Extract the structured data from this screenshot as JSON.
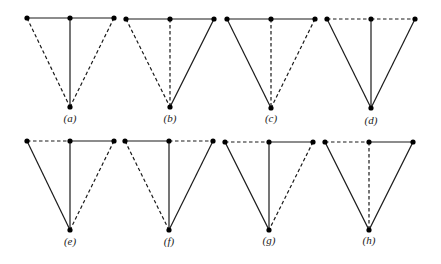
{
  "figure": {
    "colors": {
      "line": "#1a1a1a",
      "vertex": "#000000",
      "label": "#222222",
      "background": "#ffffff"
    },
    "edge_order": [
      "TL-TM",
      "TM-TR",
      "TL-B",
      "TM-B",
      "TR-B"
    ],
    "panels": [
      {
        "label": "(a)",
        "vertices": {
          "TL": [
            27,
            18
          ],
          "TM": [
            70,
            18
          ],
          "TR": [
            114,
            18
          ],
          "B": [
            70,
            107
          ]
        },
        "label_pos": [
          70,
          122
        ],
        "edges": {
          "TL-TM": "solid",
          "TM-TR": "solid",
          "TL-B": "dashed",
          "TM-B": "solid",
          "TR-B": "dashed"
        }
      },
      {
        "label": "(b)",
        "vertices": {
          "TL": [
            126,
            19
          ],
          "TM": [
            170,
            19
          ],
          "TR": [
            214,
            19
          ],
          "B": [
            170,
            107
          ]
        },
        "label_pos": [
          170,
          122
        ],
        "edges": {
          "TL-TM": "solid",
          "TM-TR": "solid",
          "TL-B": "dashed",
          "TM-B": "dashed",
          "TR-B": "solid"
        }
      },
      {
        "label": "(c)",
        "vertices": {
          "TL": [
            227,
            19
          ],
          "TM": [
            271,
            19
          ],
          "TR": [
            315,
            19
          ],
          "B": [
            271,
            108
          ]
        },
        "label_pos": [
          271,
          122
        ],
        "edges": {
          "TL-TM": "solid",
          "TM-TR": "solid",
          "TL-B": "solid",
          "TM-B": "dashed",
          "TR-B": "dashed"
        }
      },
      {
        "label": "(d)",
        "vertices": {
          "TL": [
            327,
            19
          ],
          "TM": [
            371,
            19
          ],
          "TR": [
            415,
            19
          ],
          "B": [
            371,
            108
          ]
        },
        "label_pos": [
          371,
          124
        ],
        "edges": {
          "TL-TM": "dashed",
          "TM-TR": "dashed",
          "TL-B": "solid",
          "TM-B": "solid",
          "TR-B": "solid"
        }
      },
      {
        "label": "(e)",
        "vertices": {
          "TL": [
            27,
            141
          ],
          "TM": [
            70,
            141
          ],
          "TR": [
            114,
            141
          ],
          "B": [
            70,
            230
          ]
        },
        "label_pos": [
          70,
          245
        ],
        "edges": {
          "TL-TM": "dashed",
          "TM-TR": "solid",
          "TL-B": "solid",
          "TM-B": "solid",
          "TR-B": "dashed"
        }
      },
      {
        "label": "(f)",
        "vertices": {
          "TL": [
            125,
            141
          ],
          "TM": [
            169,
            141
          ],
          "TR": [
            213,
            141
          ],
          "B": [
            169,
            230
          ]
        },
        "label_pos": [
          169,
          245
        ],
        "edges": {
          "TL-TM": "solid",
          "TM-TR": "dashed",
          "TL-B": "dashed",
          "TM-B": "solid",
          "TR-B": "solid"
        }
      },
      {
        "label": "(g)",
        "vertices": {
          "TL": [
            225,
            142
          ],
          "TM": [
            269,
            142
          ],
          "TR": [
            313,
            142
          ],
          "B": [
            269,
            230
          ]
        },
        "label_pos": [
          269,
          244
        ],
        "edges": {
          "TL-TM": "dashed",
          "TM-TR": "solid",
          "TL-B": "solid",
          "TM-B": "solid",
          "TR-B": "dashed"
        }
      },
      {
        "label": "(h)",
        "vertices": {
          "TL": [
            325,
            142
          ],
          "TM": [
            369,
            142
          ],
          "TR": [
            413,
            142
          ],
          "B": [
            369,
            230
          ]
        },
        "label_pos": [
          369,
          244
        ],
        "edges": {
          "TL-TM": "dashed",
          "TM-TR": "solid",
          "TL-B": "solid",
          "TM-B": "dashed",
          "TR-B": "solid"
        }
      }
    ]
  }
}
